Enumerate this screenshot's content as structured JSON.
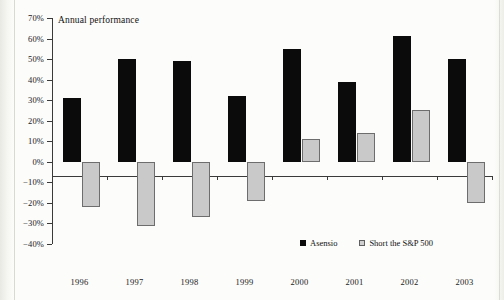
{
  "chart_data": {
    "type": "bar",
    "title": "Annual performance",
    "xlabel": "",
    "ylabel": "",
    "ylim": [
      -40,
      70
    ],
    "ytick_step": 10,
    "grid": false,
    "legend_position": "bottom-right",
    "categories": [
      "1996",
      "1997",
      "1998",
      "1999",
      "2000",
      "2001",
      "2002",
      "2003"
    ],
    "ytick_labels": [
      "70%",
      "60%",
      "50%",
      "40%",
      "30%",
      "20%",
      "10%",
      "0%",
      "-10%",
      "-20%",
      "-30%",
      "-40%"
    ],
    "ytick_values": [
      70,
      60,
      50,
      40,
      30,
      20,
      10,
      0,
      -10,
      -20,
      -30,
      -40
    ],
    "series": [
      {
        "name": "Asensio",
        "color": "#0b0b0b",
        "values": [
          31,
          50,
          49,
          32,
          55,
          39,
          61,
          50
        ]
      },
      {
        "name": "Short the S&P 500",
        "color": "#c9c9c9",
        "values": [
          -22,
          -31,
          -27,
          -19,
          11,
          14,
          25,
          -20
        ]
      }
    ]
  },
  "legend": {
    "items": [
      {
        "label": "Asensio",
        "swatch": "dark-square-icon"
      },
      {
        "label": "Short the S&P 500",
        "swatch": "light-square-icon"
      }
    ]
  }
}
